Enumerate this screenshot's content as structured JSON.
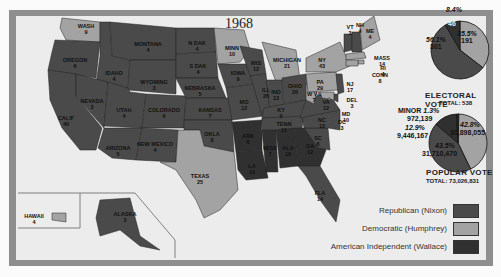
{
  "title": "1968",
  "colors": {
    "republican": "#4a4a4a",
    "democratic": "#a3a3a3",
    "independent": "#303030",
    "background": "#ececec",
    "frame": "#8e8e8e"
  },
  "states": [
    {
      "abbr": "WASH",
      "ev": "9",
      "party": "democratic"
    },
    {
      "abbr": "OREGON",
      "ev": "6",
      "party": "republican"
    },
    {
      "abbr": "CALIF",
      "ev": "40",
      "party": "republican"
    },
    {
      "abbr": "IDAHO",
      "ev": "4",
      "party": "republican"
    },
    {
      "abbr": "NEVADA",
      "ev": "3",
      "party": "republican"
    },
    {
      "abbr": "MONTANA",
      "ev": "4",
      "party": "republican"
    },
    {
      "abbr": "WYOMING",
      "ev": "3",
      "party": "republican"
    },
    {
      "abbr": "UTAH",
      "ev": "4",
      "party": "republican"
    },
    {
      "abbr": "ARIZONA",
      "ev": "5",
      "party": "republican"
    },
    {
      "abbr": "COLORADO",
      "ev": "6",
      "party": "republican"
    },
    {
      "abbr": "NEW MEXICO",
      "ev": "4",
      "party": "republican"
    },
    {
      "abbr": "N DAK",
      "ev": "4",
      "party": "republican"
    },
    {
      "abbr": "S DAK",
      "ev": "4",
      "party": "republican"
    },
    {
      "abbr": "NEBRASKA",
      "ev": "5",
      "party": "republican"
    },
    {
      "abbr": "KANSAS",
      "ev": "7",
      "party": "republican"
    },
    {
      "abbr": "OKLA",
      "ev": "8",
      "party": "republican"
    },
    {
      "abbr": "TEXAS",
      "ev": "25",
      "party": "democratic"
    },
    {
      "abbr": "MINN",
      "ev": "10",
      "party": "democratic"
    },
    {
      "abbr": "IOWA",
      "ev": "9",
      "party": "republican"
    },
    {
      "abbr": "MO",
      "ev": "12",
      "party": "republican"
    },
    {
      "abbr": "ARK",
      "ev": "6",
      "party": "independent"
    },
    {
      "abbr": "LA",
      "ev": "10",
      "party": "independent"
    },
    {
      "abbr": "WIS",
      "ev": "12",
      "party": "republican"
    },
    {
      "abbr": "ILL",
      "ev": "26",
      "party": "republican"
    },
    {
      "abbr": "MICHIGAN",
      "ev": "21",
      "party": "democratic"
    },
    {
      "abbr": "IND",
      "ev": "13",
      "party": "republican"
    },
    {
      "abbr": "OHIO",
      "ev": "26",
      "party": "republican"
    },
    {
      "abbr": "KY",
      "ev": "9",
      "party": "republican"
    },
    {
      "abbr": "TENN",
      "ev": "11",
      "party": "republican"
    },
    {
      "abbr": "MISS",
      "ev": "7",
      "party": "independent"
    },
    {
      "abbr": "ALA",
      "ev": "10",
      "party": "independent"
    },
    {
      "abbr": "GA",
      "ev": "12",
      "party": "independent"
    },
    {
      "abbr": "FLA",
      "ev": "14",
      "party": "republican"
    },
    {
      "abbr": "SC",
      "ev": "8",
      "party": "republican"
    },
    {
      "abbr": "NC",
      "ev": "12",
      "party": "republican"
    },
    {
      "abbr": "VA",
      "ev": "12",
      "party": "republican"
    },
    {
      "abbr": "W VA",
      "ev": "7",
      "party": "democratic"
    },
    {
      "abbr": "PA",
      "ev": "29",
      "party": "democratic"
    },
    {
      "abbr": "NY",
      "ev": "43",
      "party": "democratic"
    },
    {
      "abbr": "VT",
      "ev": "3",
      "party": "republican"
    },
    {
      "abbr": "NH",
      "ev": "4",
      "party": "republican"
    },
    {
      "abbr": "ME",
      "ev": "4",
      "party": "democratic"
    },
    {
      "abbr": "MASS",
      "ev": "14",
      "party": "democratic"
    },
    {
      "abbr": "RI",
      "ev": "4",
      "party": "democratic"
    },
    {
      "abbr": "CONN",
      "ev": "8",
      "party": "democratic"
    },
    {
      "abbr": "NJ",
      "ev": "17",
      "party": "republican"
    },
    {
      "abbr": "DEL",
      "ev": "3",
      "party": "republican"
    },
    {
      "abbr": "MD",
      "ev": "10",
      "party": "democratic"
    },
    {
      "abbr": "DC",
      "ev": "3",
      "party": "democratic"
    },
    {
      "abbr": "HAWAII",
      "ev": "4",
      "party": "democratic"
    },
    {
      "abbr": "ALASKA",
      "ev": "3",
      "party": "republican"
    }
  ],
  "electoral_vote": {
    "title": "ELECTORAL VOTE",
    "total_label": "TOTAL: 538",
    "slices": [
      {
        "party": "republican",
        "pct": "56.1%",
        "value": "301",
        "fraction": 0.561
      },
      {
        "party": "democratic",
        "pct": "35.5%",
        "value": "191",
        "fraction": 0.355
      },
      {
        "party": "independent",
        "pct": "8.4%",
        "value": "46",
        "fraction": 0.084
      }
    ]
  },
  "popular_vote": {
    "title": "POPULAR VOTE",
    "total_label": "TOTAL: 73,026,831",
    "slices": [
      {
        "party": "republican",
        "pct": "43.5%",
        "value": "31,710,470",
        "fraction": 0.435
      },
      {
        "party": "democratic",
        "pct": "42.8%",
        "value": "30,898,055",
        "fraction": 0.428
      },
      {
        "party": "independent",
        "pct": "12.9%",
        "value": "9,446,167",
        "fraction": 0.129
      },
      {
        "party": "minor",
        "label": "MINOR",
        "pct": "1.3%",
        "value": "972,139",
        "fraction": 0.013
      }
    ]
  },
  "legend": [
    {
      "label": "Republican (Nixon)",
      "party": "republican"
    },
    {
      "label": "Democratic (Humphrey)",
      "party": "democratic"
    },
    {
      "label": "American Independent (Wallace)",
      "party": "independent"
    }
  ]
}
